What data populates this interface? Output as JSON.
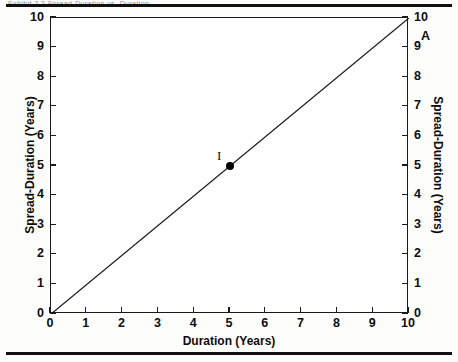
{
  "figure": {
    "clipped_header_text": "Exhibit 2.2  Spread-Duration vs. Duration",
    "rules": {
      "top": true,
      "bottom": true
    }
  },
  "chart_data": {
    "type": "line",
    "title": "",
    "subtitle": "",
    "xlabel": "Duration (Years)",
    "ylabel": "Spread-Duration (Years)",
    "ylabel_right": "Spread-Duration (Years)",
    "xlim": [
      0,
      10
    ],
    "ylim": [
      0,
      10
    ],
    "xticks": [
      0,
      1,
      2,
      3,
      4,
      5,
      6,
      7,
      8,
      9,
      10
    ],
    "yticks": [
      0,
      1,
      2,
      3,
      4,
      5,
      6,
      7,
      8,
      9,
      10
    ],
    "xtick_labels": [
      "0",
      "1",
      "2",
      "3",
      "4",
      "5",
      "6",
      "7",
      "8",
      "9",
      "10"
    ],
    "ytick_labels": [
      "0",
      "1",
      "2",
      "3",
      "4",
      "5",
      "6",
      "7",
      "8",
      "9",
      "10"
    ],
    "ytick_labels_right": [
      "0",
      "1",
      "2",
      "3",
      "4",
      "5",
      "6",
      "7",
      "8",
      "9",
      "10"
    ],
    "grid": false,
    "legend": null,
    "line_color": "#1a1a1a",
    "marker_color": "#000000",
    "series": [
      {
        "name": "identity",
        "x": [
          0,
          10
        ],
        "values": [
          0,
          10
        ],
        "style": "solid"
      }
    ],
    "points": [
      {
        "label": "I",
        "x": 5,
        "y": 5,
        "marker": "filled-circle",
        "label_dx": -13,
        "label_dy": -17,
        "label_style": "serif"
      },
      {
        "label": "A",
        "x": 10,
        "y": 10,
        "marker": "none",
        "label_dx": 12,
        "label_dy": 12,
        "label_style": "bold"
      }
    ]
  }
}
